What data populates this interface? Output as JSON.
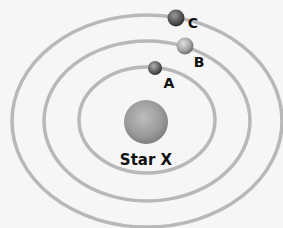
{
  "diagram": {
    "star": {
      "label": "Star X",
      "color": "#9a9a9a"
    },
    "planets": [
      {
        "id": "A",
        "label": "A",
        "orbit": "inner"
      },
      {
        "id": "B",
        "label": "B",
        "orbit": "middle"
      },
      {
        "id": "C",
        "label": "C",
        "orbit": "outer"
      }
    ],
    "orbits": [
      "inner",
      "middle",
      "outer"
    ],
    "colors": {
      "background": "#f6f6f6",
      "orbit_stroke": "#b8b8b8",
      "label": "#111111"
    }
  }
}
